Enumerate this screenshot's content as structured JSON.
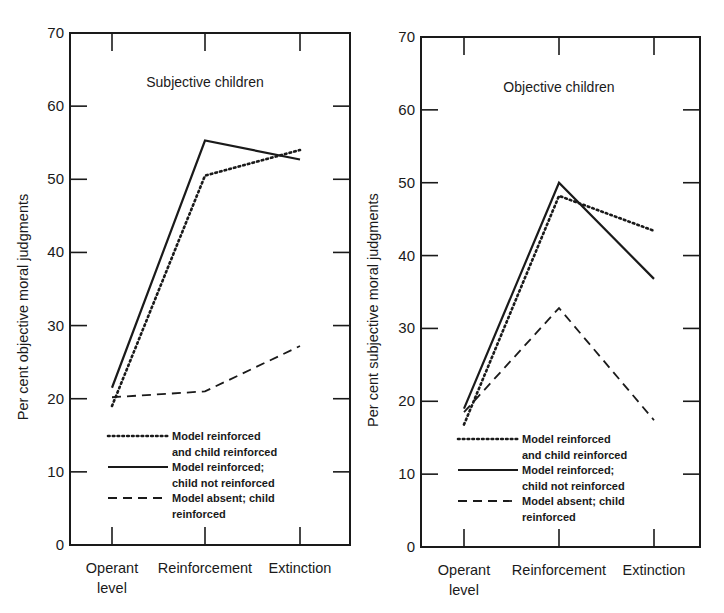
{
  "chart_data": [
    {
      "type": "line",
      "title": "Subjective children",
      "xlabel": "",
      "ylabel": "Per cent objective moral judgments",
      "categories": [
        "Operant level",
        "Reinforcement",
        "Extinction"
      ],
      "category_lines": [
        [
          "Operant",
          "level"
        ],
        [
          "Reinforcement"
        ],
        [
          "Extinction"
        ]
      ],
      "ylim": [
        0,
        70
      ],
      "yticks": [
        0,
        10,
        20,
        30,
        40,
        50,
        60,
        70
      ],
      "grid": false,
      "legend_position": "lower-left inside",
      "series": [
        {
          "name": "Model reinforced and child reinforced",
          "legend_lines": [
            "Model reinforced",
            "and child reinforced"
          ],
          "style": "dotted",
          "values": [
            19,
            50.5,
            54
          ]
        },
        {
          "name": "Model reinforced; child not reinforced",
          "legend_lines": [
            "Model reinforced;",
            "child not reinforced"
          ],
          "style": "solid",
          "values": [
            21.5,
            55.3,
            52.7
          ]
        },
        {
          "name": "Model absent; child reinforced",
          "legend_lines": [
            "Model absent; child",
            "reinforced"
          ],
          "style": "dashed",
          "values": [
            20.2,
            21,
            27.2
          ]
        }
      ]
    },
    {
      "type": "line",
      "title": "Objective children",
      "xlabel": "",
      "ylabel": "Per cent subjective moral judgments",
      "categories": [
        "Operant level",
        "Reinforcement",
        "Extinction"
      ],
      "category_lines": [
        [
          "Operant",
          "level"
        ],
        [
          "Reinforcement"
        ],
        [
          "Extinction"
        ]
      ],
      "ylim": [
        0,
        70
      ],
      "yticks": [
        0,
        10,
        20,
        30,
        40,
        50,
        60,
        70
      ],
      "grid": false,
      "legend_position": "lower-left inside",
      "series": [
        {
          "name": "Model reinforced and child reinforced",
          "legend_lines": [
            "Model reinforced",
            "and child reinforced"
          ],
          "style": "dotted",
          "values": [
            16.8,
            48.2,
            43.4
          ]
        },
        {
          "name": "Model reinforced; child not reinforced",
          "legend_lines": [
            "Model reinforced;",
            "child not reinforced"
          ],
          "style": "solid",
          "values": [
            19,
            50,
            36.8
          ]
        },
        {
          "name": "Model absent; child reinforced",
          "legend_lines": [
            "Model absent; child",
            "reinforced"
          ],
          "style": "dashed",
          "values": [
            18.5,
            32.8,
            17.4
          ]
        }
      ]
    }
  ],
  "colors": {
    "ink": "#1a1a1a",
    "background": "#ffffff"
  }
}
